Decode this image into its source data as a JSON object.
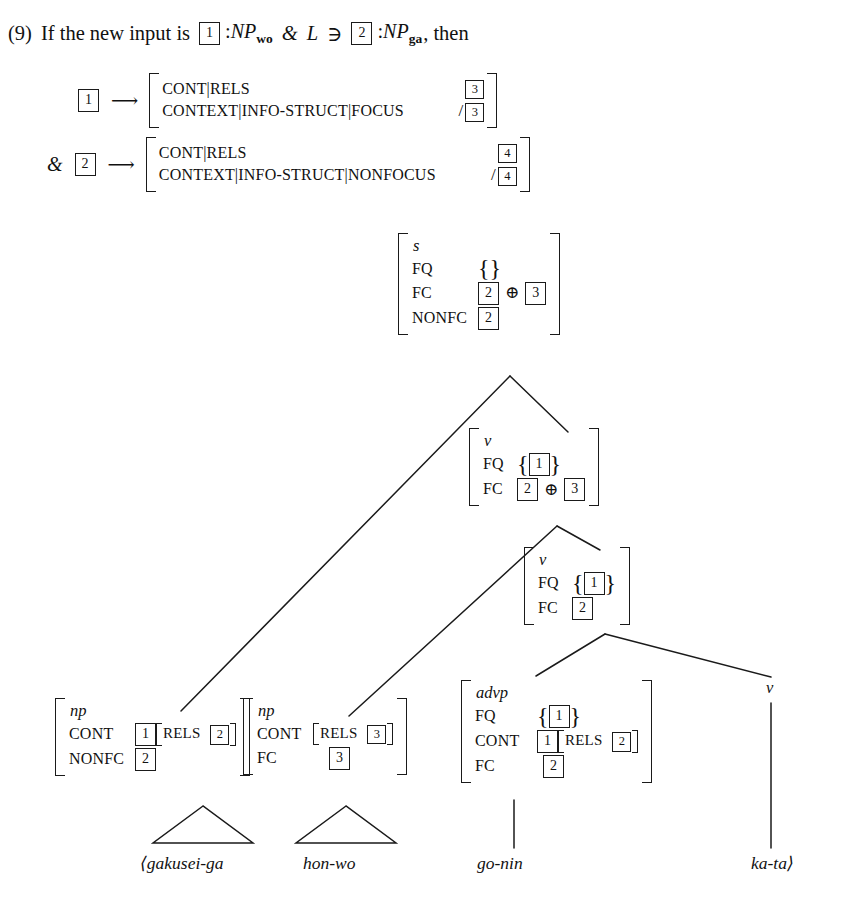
{
  "example": {
    "number": "(9)",
    "statement_prefix": "If the new input is",
    "tag_a": "1",
    "np_wo": "NP",
    "np_wo_sub": "wo",
    "conj": "&",
    "lang_L": "L",
    "member": "∋",
    "tag_b": "2",
    "np_ga": "NP",
    "np_ga_sub": "ga",
    "statement_suffix": ", then"
  },
  "rules": [
    {
      "lhs_tag": "1",
      "arrow": "⟶",
      "features": [
        {
          "name": "CONT|RELS",
          "tag": "3",
          "slash": false
        },
        {
          "name": "CONTEXT|INFO-STRUCT|FOCUS",
          "tag": "3",
          "slash": true
        }
      ]
    },
    {
      "prefix": "&",
      "lhs_tag": "2",
      "arrow": "⟶",
      "features": [
        {
          "name": "CONT|RELS",
          "tag": "4",
          "slash": false
        },
        {
          "name": "CONTEXT|INFO-STRUCT|NONFOCUS",
          "tag": "4",
          "slash": true
        }
      ]
    }
  ],
  "slash": "/",
  "tree": {
    "nodes": [
      {
        "id": "root-s",
        "type": "s",
        "rows": [
          {
            "feature": "FQ",
            "value_kind": "empty-set",
            "open": "{",
            "close": "}"
          },
          {
            "feature": "FC",
            "value_kind": "sum",
            "tags": [
              "2",
              "3"
            ],
            "op": "⊕"
          },
          {
            "feature": "NONFC",
            "value_kind": "tag",
            "tags": [
              "2"
            ]
          }
        ]
      },
      {
        "id": "node-v1",
        "type": "v",
        "rows": [
          {
            "feature": "FQ",
            "value_kind": "set",
            "open": "{",
            "close": "}",
            "tags": [
              "1"
            ]
          },
          {
            "feature": "FC",
            "value_kind": "sum",
            "tags": [
              "2",
              "3"
            ],
            "op": "⊕"
          }
        ]
      },
      {
        "id": "node-v2",
        "type": "v",
        "rows": [
          {
            "feature": "FQ",
            "value_kind": "set",
            "open": "{",
            "close": "}",
            "tags": [
              "1"
            ]
          },
          {
            "feature": "FC",
            "value_kind": "tag",
            "tags": [
              "2"
            ]
          }
        ]
      },
      {
        "id": "leaf-np1",
        "type": "np",
        "rows": [
          {
            "feature": "CONT",
            "value_kind": "tag-bracket",
            "tags": [
              "1"
            ],
            "inner_feature": "RELS",
            "inner_tag": "2"
          },
          {
            "feature": "NONFC",
            "value_kind": "tag",
            "tags": [
              "2"
            ]
          }
        ]
      },
      {
        "id": "leaf-np2",
        "type": "np",
        "rows": [
          {
            "feature": "CONT",
            "value_kind": "bracket",
            "inner_feature": "RELS",
            "inner_tag": "3"
          },
          {
            "feature": "FC",
            "value_kind": "tag",
            "tags": [
              "3"
            ]
          }
        ]
      },
      {
        "id": "leaf-advp",
        "type": "advp",
        "rows": [
          {
            "feature": "FQ",
            "value_kind": "set",
            "open": "{",
            "close": "}",
            "tags": [
              "1"
            ]
          },
          {
            "feature": "CONT",
            "value_kind": "tag-bracket",
            "tags": [
              "1"
            ],
            "inner_feature": "RELS",
            "inner_tag": "2"
          },
          {
            "feature": "FC",
            "value_kind": "tag",
            "tags": [
              "2"
            ]
          }
        ]
      },
      {
        "id": "leaf-v3",
        "type": "v",
        "rows": []
      }
    ],
    "terminals": [
      {
        "id": "term-gakusei",
        "text": "⟨gakusei-ga",
        "connector": "triangle"
      },
      {
        "id": "term-hon",
        "text": "hon-wo",
        "connector": "triangle"
      },
      {
        "id": "term-gonin",
        "text": "go-nin",
        "connector": "line"
      },
      {
        "id": "term-kata",
        "text": "ka-ta⟩",
        "connector": "line"
      }
    ]
  },
  "colors": {
    "ink": "#1a1a1a",
    "page": "#ffffff"
  }
}
